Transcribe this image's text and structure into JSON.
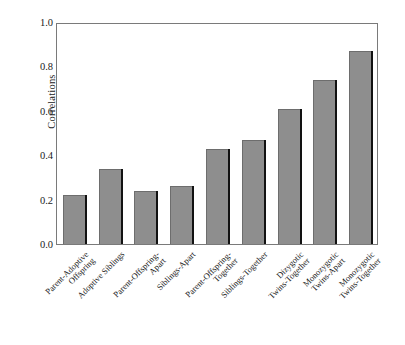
{
  "chart_data": {
    "type": "bar",
    "title": "",
    "xlabel": "",
    "ylabel": "Correlations",
    "ylim": [
      0.0,
      1.0
    ],
    "yticks": [
      "0.0",
      "0.2",
      "0.4",
      "0.6",
      "0.8",
      "1.0"
    ],
    "ytick_values": [
      0.0,
      0.2,
      0.4,
      0.6,
      0.8,
      1.0
    ],
    "grid": false,
    "legend": "none",
    "bar_color": "#8e8e8e",
    "bar_shadow_color": "#121212",
    "axis_color": "#7a7a7a",
    "categories": [
      "Parent-Adoptive\nOffspring",
      "Adoptive Siblings",
      "Parent-Offspring-\nApart",
      "Siblings-Apart",
      "Parent-Offspring-\nTogether",
      "Siblings-Together",
      "Dizygotic\nTwins-Together",
      "Monozygotic\nTwins-Apart",
      "Monozygotic\nTwins-Together"
    ],
    "values": [
      0.22,
      0.34,
      0.24,
      0.26,
      0.43,
      0.47,
      0.61,
      0.74,
      0.87
    ]
  }
}
